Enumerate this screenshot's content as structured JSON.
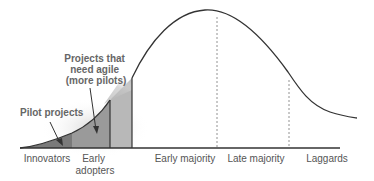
{
  "segments": [
    {
      "label_lines": [
        "Innovators"
      ]
    },
    {
      "label_lines": [
        "Early",
        "adopters"
      ]
    },
    {
      "label_lines": [
        "Early majority"
      ]
    },
    {
      "label_lines": [
        "Late majority"
      ]
    },
    {
      "label_lines": [
        "Laggards"
      ]
    }
  ],
  "annotations": [
    {
      "lines": [
        "Pilot projects"
      ],
      "points_to": "Innovators"
    },
    {
      "lines": [
        "Projects that",
        "need agile",
        "(more pilots)"
      ],
      "points_to": "Early adopters"
    }
  ],
  "colors": {
    "curve": "#333333",
    "innovators_fill": "#7a7a7a",
    "early_adopters_fill": "#9a9a9a",
    "transition_fill": "#bdbdbd",
    "text": "#555555",
    "annotation_text": "#666666"
  }
}
